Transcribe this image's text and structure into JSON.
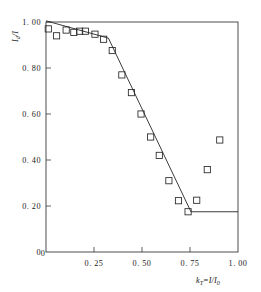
{
  "figure": {
    "background_color": "#ffffff",
    "line_color": "#262626",
    "axis_color": "#3a3a3a",
    "marker_shape": "open-square"
  },
  "axes": {
    "x": {
      "label_main": "k",
      "label_sub": "T",
      "label_rest": "=I/I",
      "label_rest_sub": "0",
      "label_full": "k_T=I/I_0",
      "ticks": [
        "0",
        "0. 25",
        "0. 50",
        "0. 75",
        "1. 00"
      ],
      "tick_values": [
        0,
        0.25,
        0.5,
        0.75,
        1.0
      ],
      "min": 0,
      "max": 1.0
    },
    "y": {
      "label_main": "I",
      "label_sub": "d",
      "label_rest": "/I",
      "label_full": "I_d/I",
      "ticks": [
        "0",
        "0. 20",
        "0. 40",
        "0. 60",
        "0. 80",
        "1. 00"
      ],
      "tick_values": [
        0,
        0.2,
        0.4,
        0.6,
        0.8,
        1.0
      ],
      "min": 0,
      "max": 1.0
    }
  },
  "chart_data": {
    "type": "scatter",
    "title": "",
    "subtitle": "",
    "xlabel": "k_T=I/I_0",
    "ylabel": "I_d/I",
    "xlim": [
      0,
      1.0
    ],
    "ylim": [
      0,
      1.0
    ],
    "grid": false,
    "legend": null,
    "legend_position": "none",
    "xticks": [
      0,
      0.25,
      0.5,
      0.75,
      1.0
    ],
    "xticklabels": [
      "0",
      "0. 25",
      "0. 50",
      "0. 75",
      "1. 00"
    ],
    "yticks": [
      0,
      0.2,
      0.4,
      0.6,
      0.8,
      1.0
    ],
    "yticklabels": [
      "0",
      "0. 20",
      "0. 40",
      "0. 60",
      "0. 80",
      "1. 00"
    ],
    "series": [
      {
        "name": "measured",
        "type": "scatter",
        "marker": "open-square",
        "x": [
          0.012,
          0.055,
          0.105,
          0.145,
          0.175,
          0.205,
          0.255,
          0.3,
          0.345,
          0.395,
          0.445,
          0.495,
          0.545,
          0.59,
          0.64,
          0.69,
          0.74,
          0.785,
          0.84,
          0.905
        ],
        "y": [
          0.97,
          0.94,
          0.965,
          0.955,
          0.96,
          0.96,
          0.947,
          0.925,
          0.876,
          0.77,
          0.693,
          0.6,
          0.5,
          0.42,
          0.31,
          0.223,
          0.175,
          0.225,
          0.358,
          0.487
        ]
      },
      {
        "name": "model",
        "type": "line",
        "x": [
          0.0,
          0.325,
          0.755,
          1.0
        ],
        "y": [
          1.005,
          0.93,
          0.175,
          0.175
        ]
      }
    ]
  }
}
